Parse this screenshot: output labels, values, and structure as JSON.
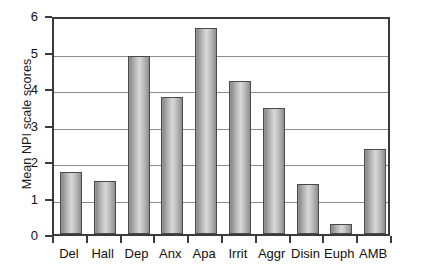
{
  "chart_data": {
    "type": "bar",
    "title": "",
    "subtitle": "",
    "xlabel": "",
    "ylabel": "Mean NPI scale scores",
    "categories": [
      "Del",
      "Hall",
      "Dep",
      "Anx",
      "Apa",
      "Irrit",
      "Aggr",
      "Disin",
      "Euph",
      "AMB"
    ],
    "values": [
      1.71,
      1.46,
      4.87,
      3.75,
      5.65,
      4.18,
      3.44,
      1.36,
      0.27,
      2.33
    ],
    "ylim": [
      0,
      6
    ],
    "ytick_labels": [
      "0",
      "1",
      "2",
      "3",
      "4",
      "5",
      "6"
    ],
    "ytick_values": [
      0,
      1,
      2,
      3,
      4,
      5,
      6
    ],
    "grid": "horizontal",
    "legend": "none",
    "bar_color": "#b8b8b8",
    "bar_edge_color": "#4a4a4a",
    "gridline_color": "#8c8c8c",
    "axis_color": "#3b3b3b",
    "background_color": "#ffffff",
    "annotations": []
  }
}
